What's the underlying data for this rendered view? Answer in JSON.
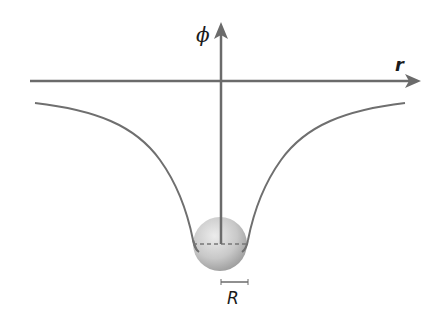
{
  "diagram": {
    "labels": {
      "y_axis": "ϕ",
      "x_axis": "r",
      "radius": "R"
    },
    "colors": {
      "axis": "#6b6b6b",
      "curve": "#6f6f6f",
      "sphere_light": "#e6e6e6",
      "sphere_dark": "#9a9a9a",
      "text": "#1a1a1a"
    },
    "elements": [
      {
        "id": "x-axis",
        "type": "arrow",
        "from": [
          30,
          81
        ],
        "to": [
          421,
          81
        ]
      },
      {
        "id": "y-axis",
        "type": "arrow",
        "from": [
          221,
          244
        ],
        "to": [
          221,
          22
        ]
      },
      {
        "id": "potential-curve",
        "type": "curve",
        "shape": "well",
        "left_start": [
          35,
          103
        ],
        "right_end": [
          405,
          103
        ],
        "bottom_y": 245
      },
      {
        "id": "sphere",
        "type": "circle",
        "center": [
          220,
          244
        ],
        "radius": 27
      },
      {
        "id": "radius-dashed-line",
        "type": "dashed-line",
        "from": [
          193,
          244
        ],
        "to": [
          248,
          244
        ]
      },
      {
        "id": "radius-bar",
        "type": "scale-bar",
        "from": [
          221,
          282
        ],
        "to": [
          248,
          282
        ]
      }
    ]
  }
}
